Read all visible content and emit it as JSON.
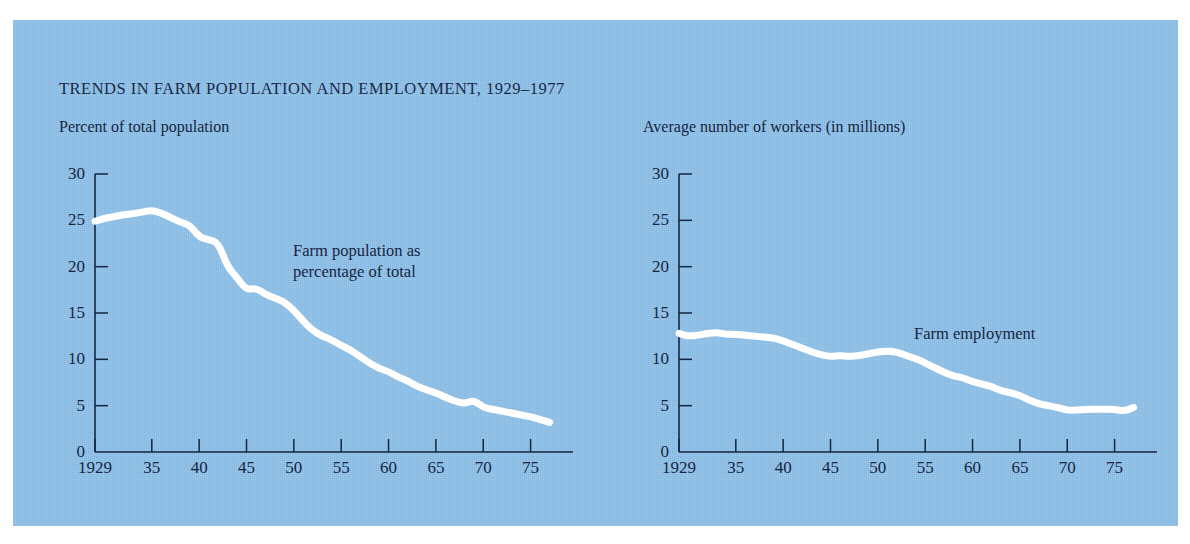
{
  "figure": {
    "title": "TRENDS IN FARM POPULATION AND EMPLOYMENT, 1929–1977",
    "background_color": "#8dc0e9",
    "line_color": "#ffffff",
    "text_color": "#16253f"
  },
  "chart_data": [
    {
      "type": "line",
      "panel": "left",
      "title": "Percent of total population",
      "ylabel": "Percent of total population",
      "xlabel": "",
      "annotation": "Farm population as\npercentage of total",
      "annotation_lines": [
        "Farm population as",
        "percentage of total"
      ],
      "series_name": "Farm population as percentage of total",
      "xlim": [
        1929,
        1978
      ],
      "ylim": [
        0,
        30
      ],
      "yticks": [
        0,
        5,
        10,
        15,
        20,
        25,
        30
      ],
      "ytick_labels": [
        "0",
        "5",
        "10",
        "15",
        "20",
        "25",
        "30"
      ],
      "xticks": [
        1929,
        1935,
        1940,
        1945,
        1950,
        1955,
        1960,
        1965,
        1970,
        1975
      ],
      "xtick_labels": [
        "1929",
        "35",
        "40",
        "45",
        "50",
        "55",
        "60",
        "65",
        "70",
        "75"
      ],
      "grid": false,
      "legend_position": "none",
      "x": [
        1929,
        1930,
        1931,
        1932,
        1933,
        1934,
        1935,
        1936,
        1937,
        1938,
        1939,
        1940,
        1941,
        1942,
        1943,
        1944,
        1945,
        1946,
        1947,
        1948,
        1949,
        1950,
        1951,
        1952,
        1953,
        1954,
        1955,
        1956,
        1957,
        1958,
        1959,
        1960,
        1961,
        1962,
        1963,
        1964,
        1965,
        1966,
        1967,
        1968,
        1969,
        1970,
        1971,
        1972,
        1973,
        1974,
        1975,
        1976,
        1977
      ],
      "values": [
        24.9,
        25.2,
        25.4,
        25.6,
        25.7,
        25.9,
        26.1,
        25.8,
        25.3,
        24.8,
        24.5,
        23.2,
        22.9,
        22.6,
        20.0,
        18.8,
        17.5,
        17.7,
        17.0,
        16.6,
        16.2,
        15.3,
        14.1,
        13.1,
        12.5,
        12.1,
        11.5,
        11.0,
        10.3,
        9.6,
        9.0,
        8.7,
        8.1,
        7.7,
        7.1,
        6.7,
        6.4,
        5.9,
        5.5,
        5.2,
        5.6,
        4.8,
        4.6,
        4.4,
        4.2,
        4.0,
        3.8,
        3.5,
        3.2
      ]
    },
    {
      "type": "line",
      "panel": "right",
      "title": "Average number of workers (in millions)",
      "ylabel": "Average number of workers (in millions)",
      "xlabel": "",
      "annotation": "Farm employment",
      "annotation_lines": [
        "Farm employment"
      ],
      "series_name": "Farm employment",
      "xlim": [
        1929,
        1978
      ],
      "ylim": [
        0,
        30
      ],
      "yticks": [
        0,
        5,
        10,
        15,
        20,
        25,
        30
      ],
      "ytick_labels": [
        "0",
        "5",
        "10",
        "15",
        "20",
        "25",
        "30"
      ],
      "xticks": [
        1929,
        1935,
        1940,
        1945,
        1950,
        1955,
        1960,
        1965,
        1970,
        1975
      ],
      "xtick_labels": [
        "1929",
        "35",
        "40",
        "45",
        "50",
        "55",
        "60",
        "65",
        "70",
        "75"
      ],
      "grid": false,
      "legend_position": "none",
      "x": [
        1929,
        1930,
        1931,
        1932,
        1933,
        1934,
        1935,
        1936,
        1937,
        1938,
        1939,
        1940,
        1941,
        1942,
        1943,
        1944,
        1945,
        1946,
        1947,
        1948,
        1949,
        1950,
        1951,
        1952,
        1953,
        1954,
        1955,
        1956,
        1957,
        1958,
        1959,
        1960,
        1961,
        1962,
        1963,
        1964,
        1965,
        1966,
        1967,
        1968,
        1969,
        1970,
        1971,
        1972,
        1973,
        1974,
        1975,
        1976,
        1977
      ],
      "values": [
        12.8,
        12.5,
        12.6,
        12.8,
        12.9,
        12.7,
        12.7,
        12.6,
        12.5,
        12.4,
        12.3,
        12.0,
        11.6,
        11.2,
        10.8,
        10.5,
        10.3,
        10.4,
        10.3,
        10.4,
        10.6,
        10.8,
        10.9,
        10.8,
        10.4,
        10.1,
        9.6,
        9.1,
        8.6,
        8.2,
        8.0,
        7.6,
        7.3,
        7.1,
        6.6,
        6.4,
        6.1,
        5.6,
        5.2,
        5.0,
        4.8,
        4.5,
        4.5,
        4.6,
        4.6,
        4.6,
        4.6,
        4.4,
        4.8
      ]
    }
  ]
}
